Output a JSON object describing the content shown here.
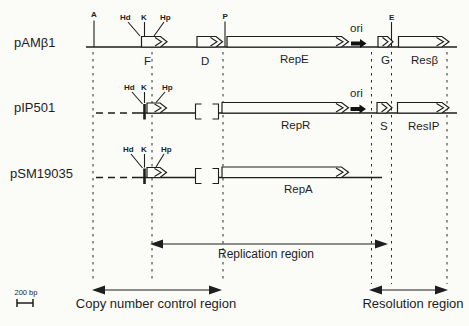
{
  "colors": {
    "ink": "#1e1e1e",
    "background": "#fbfbf8"
  },
  "plasmids": [
    {
      "name": "pAMβ1",
      "ori_label": "ori",
      "sites": {
        "A": "A",
        "Hd": "Hd",
        "K": "K",
        "Hp": "Hp",
        "P": "P",
        "E": "E"
      },
      "genes": {
        "F": "F",
        "D": "D",
        "RepE": "RepE",
        "G": "G",
        "ResBeta": "Resβ"
      }
    },
    {
      "name": "pIP501",
      "ori_label": "ori",
      "sites": {
        "Hd": "Hd",
        "K": "K",
        "Hp": "Hp"
      },
      "genes": {
        "RepR": "RepR",
        "S": "S",
        "ResIP": "ResIP"
      }
    },
    {
      "name": "pSM19035",
      "sites": {
        "Hd": "Hd",
        "K": "K",
        "Hp": "Hp"
      },
      "genes": {
        "RepA": "RepA"
      }
    }
  ],
  "regions": {
    "replication": "Replication region",
    "copy_number": "Copy number control region",
    "resolution": "Resolution region"
  },
  "scale_bar": {
    "label": "200 bp"
  }
}
